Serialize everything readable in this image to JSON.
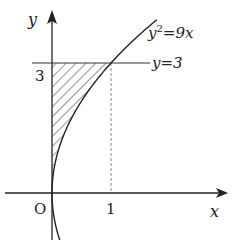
{
  "diagram": {
    "type": "coordinate-graph",
    "axes": {
      "x_label": "x",
      "y_label": "y",
      "origin_label": "O"
    },
    "ticks": {
      "x_tick_label": "1",
      "y_tick_label": "3"
    },
    "curves": [
      {
        "name": "parabola",
        "equation_base": "y",
        "equation_exp": "2",
        "equation_rest": "=9x",
        "relation": "y^2 = 9x"
      },
      {
        "name": "horizontal-line",
        "equation": "y=3",
        "relation": "y = 3"
      }
    ],
    "guide_line": {
      "relation": "x = 1",
      "style": "dashed"
    },
    "shaded_region": {
      "description": "region bounded by y-axis, y=3, and y^2=9x",
      "pattern": "diagonal-hatch",
      "x_range": [
        0,
        1
      ],
      "y_range": [
        0,
        3
      ]
    },
    "colors": {
      "stroke": "#222222",
      "dashed": "#888888"
    }
  }
}
